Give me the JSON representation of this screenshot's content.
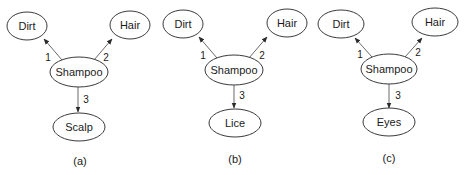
{
  "panels": [
    {
      "caption": "(a)",
      "nodes": {
        "left": "Dirt",
        "right": "Hair",
        "center": "Shampoo",
        "bottom": "Scalp"
      },
      "edges": {
        "left": "1",
        "right": "2",
        "bottom": "3"
      }
    },
    {
      "caption": "(b)",
      "nodes": {
        "left": "Dirt",
        "right": "Hair",
        "center": "Shampoo",
        "bottom": "Lice"
      },
      "edges": {
        "left": "1",
        "right": "2",
        "bottom": "3"
      }
    },
    {
      "caption": "(c)",
      "nodes": {
        "left": "Dirt",
        "right": "Hair",
        "center": "Shampoo",
        "bottom": "Eyes"
      },
      "edges": {
        "left": "1",
        "right": "2",
        "bottom": "3"
      }
    }
  ]
}
